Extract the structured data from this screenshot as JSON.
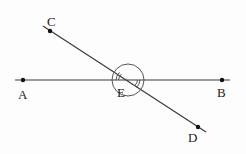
{
  "diagram": {
    "type": "geometry-intersecting-lines",
    "colors": {
      "line": "#3a3a3a",
      "point": "#111111",
      "label": "#222222",
      "background": "#fdfdfd"
    },
    "points": {
      "A": {
        "label": "A",
        "x": 23,
        "y": 80,
        "label_x": 18,
        "label_y": 99
      },
      "B": {
        "label": "B",
        "x": 222,
        "y": 80,
        "label_x": 217,
        "label_y": 97
      },
      "C": {
        "label": "C",
        "x": 50,
        "y": 31,
        "label_x": 47,
        "label_y": 25
      },
      "D": {
        "label": "D",
        "x": 198,
        "y": 127,
        "label_x": 188,
        "label_y": 141
      },
      "E": {
        "label": "E",
        "x": 130,
        "y": 80,
        "label_x": 118,
        "label_y": 96
      }
    },
    "lines": [
      {
        "name": "line-AB",
        "x1": 15,
        "y1": 80,
        "x2": 230,
        "y2": 80
      },
      {
        "name": "line-CD",
        "x1": 43,
        "y1": 26,
        "x2": 206,
        "y2": 132
      }
    ],
    "angle_marks": {
      "circle": {
        "cx": 128,
        "cy": 80,
        "r": 16
      },
      "double_arc_note": "Double arc marks angle AEC"
    }
  }
}
